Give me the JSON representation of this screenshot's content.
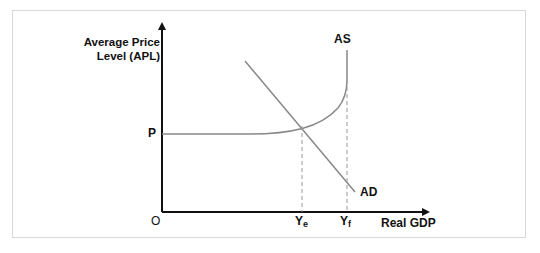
{
  "diagram": {
    "y_axis_label_line1": "Average Price",
    "y_axis_label_line2": "Level (APL)",
    "x_axis_label": "Real GDP",
    "origin_label": "O",
    "price_label": "P",
    "as_label": "AS",
    "ad_label": "AD",
    "ye_main": "Y",
    "ye_sub": "e",
    "yf_main": "Y",
    "yf_sub": "f",
    "colors": {
      "axis": "#111111",
      "curve": "#888888",
      "dashed": "#999999",
      "frame": "#d8d8d8"
    }
  }
}
